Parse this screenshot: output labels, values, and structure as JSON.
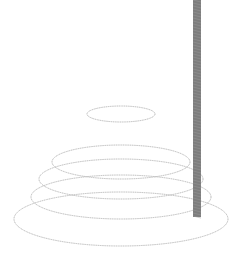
{
  "scene": {
    "description": "Stacked rings floating around a vertical pole",
    "colors": {
      "background": "#ffffff",
      "ring_stroke": "#b8b8b8",
      "pole": "#7d7d7d"
    },
    "ring_count": 5,
    "pole_count": 1
  }
}
